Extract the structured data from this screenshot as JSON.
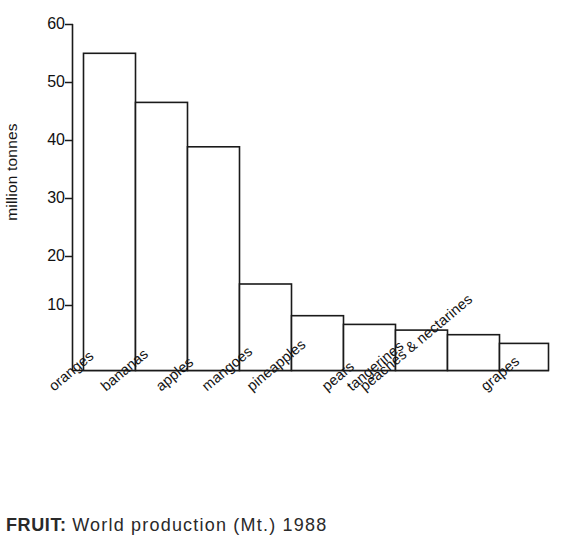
{
  "chart_data": {
    "type": "bar",
    "title": "",
    "xlabel": "",
    "ylabel": "million tonnes",
    "ylim": [
      0,
      60
    ],
    "yticks": [
      10,
      20,
      30,
      40,
      50,
      60
    ],
    "grid": false,
    "legend": false,
    "bar_style": "outlined",
    "categories": [
      "oranges",
      "bananas",
      "apples",
      "mangoes",
      "pineapples",
      "pears",
      "tangerines",
      "peaches & nectarines",
      "grapes"
    ],
    "values": [
      55,
      46.5,
      38.8,
      15,
      9.5,
      8,
      7,
      6.2,
      4.7
    ],
    "units": "million tonnes"
  },
  "axis": {
    "y_title": "million tonnes",
    "tick_labels": [
      "60",
      "50",
      "40",
      "30",
      "20",
      "10"
    ]
  },
  "categories": {
    "c0": "oranges",
    "c1": "bananas",
    "c2": "apples",
    "c3": "mangoes",
    "c4": "pineapples",
    "c5": "pears",
    "c6": "tangerines",
    "c7": "peaches & nectarines",
    "c8": "grapes"
  },
  "caption": {
    "label": "FRUIT:",
    "rest": "World  production  (Mt.)  1988"
  },
  "colors": {
    "bar_stroke": "#1a1a1a",
    "bar_fill": "#ffffff",
    "axis": "#1a1a1a",
    "text": "#141414",
    "background": "#ffffff"
  }
}
